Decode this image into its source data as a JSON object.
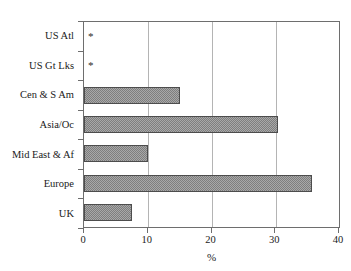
{
  "chart_data": {
    "type": "bar",
    "orientation": "horizontal",
    "title": "",
    "title_note": "title cropped off at top edge of screenshot",
    "xlabel": "%",
    "ylabel": "",
    "xlim": [
      0,
      40
    ],
    "xticks": [
      0,
      10,
      20,
      30,
      40
    ],
    "xticklabels": [
      "0",
      "10",
      "20",
      "30",
      "40"
    ],
    "grid": "vertical gridlines at 10, 20, 30",
    "legend": "none",
    "categories": [
      "US Atl",
      "US Gt Lks",
      "Cen & S Am",
      "Asia/Oc",
      "Mid East & Af",
      "Europe",
      "UK"
    ],
    "values": [
      0,
      0,
      15,
      30.5,
      10,
      35.8,
      7.5
    ],
    "annotations": [
      {
        "category": "US Atl",
        "marker": "*"
      },
      {
        "category": "US Gt Lks",
        "marker": "*"
      }
    ],
    "bar_fill": "#a8a8a8",
    "bar_edge": "#4d4d4d"
  },
  "axis": {
    "x_title": "%",
    "tick_labels": [
      "0",
      "10",
      "20",
      "30",
      "40"
    ]
  },
  "rows": [
    {
      "label": "US Atl",
      "value": 0,
      "marker": "*",
      "has_bar": false
    },
    {
      "label": "US Gt Lks",
      "value": 0,
      "marker": "*",
      "has_bar": false
    },
    {
      "label": "Cen & S Am",
      "value": 15,
      "marker": "",
      "has_bar": true
    },
    {
      "label": "Asia/Oc",
      "value": 30.5,
      "marker": "",
      "has_bar": true
    },
    {
      "label": "Mid East & Af",
      "value": 10,
      "marker": "",
      "has_bar": true
    },
    {
      "label": "Europe",
      "value": 35.8,
      "marker": "",
      "has_bar": true
    },
    {
      "label": "UK",
      "value": 7.5,
      "marker": "",
      "has_bar": true
    }
  ]
}
